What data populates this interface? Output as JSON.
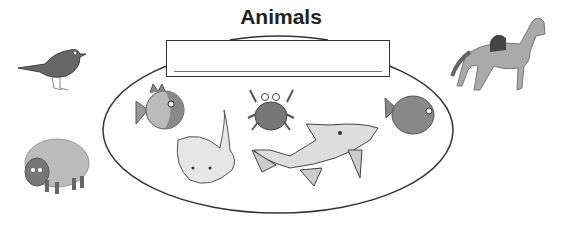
{
  "worksheet": {
    "title": "Animals",
    "answer_box": {
      "value": ""
    },
    "group_label": "sea animals",
    "inside_group": [
      {
        "name": "orange fish",
        "icon": "fish-icon"
      },
      {
        "name": "stingray",
        "icon": "stingray-icon"
      },
      {
        "name": "crab",
        "icon": "crab-icon"
      },
      {
        "name": "shark",
        "icon": "shark-icon"
      },
      {
        "name": "round fish",
        "icon": "fish-icon"
      }
    ],
    "outside_group": [
      {
        "name": "bird",
        "icon": "bird-icon"
      },
      {
        "name": "sheep",
        "icon": "sheep-icon"
      },
      {
        "name": "horse",
        "icon": "horse-icon"
      }
    ]
  }
}
